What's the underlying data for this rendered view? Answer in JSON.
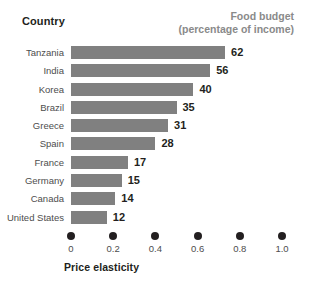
{
  "header": {
    "country_label": "Country",
    "budget_label_line1": "Food budget",
    "budget_label_line2": "(percentage of income)"
  },
  "axis": {
    "title": "Price elasticity",
    "tick_labels": [
      "0",
      "0.2",
      "0.4",
      "0.6",
      "0.8",
      "1.0"
    ]
  },
  "colors": {
    "bar": "#808080",
    "value_text": "#231f20",
    "country_text": "#4d4d4d",
    "budget_header_text": "#8a8a8a",
    "background": "#ffffff"
  },
  "chart_data": {
    "type": "bar",
    "orientation": "horizontal",
    "title": "",
    "xlabel": "Price elasticity",
    "ylabel": "Country",
    "xlim": [
      0,
      1.0
    ],
    "xticks": [
      0,
      0.2,
      0.4,
      0.6,
      0.8,
      1.0
    ],
    "grid": false,
    "legend": "none",
    "categories": [
      "Tanzania",
      "India",
      "Korea",
      "Brazil",
      "Greece",
      "Spain",
      "France",
      "Germany",
      "Canada",
      "United States"
    ],
    "series": [
      {
        "name": "Price elasticity",
        "encoding": "bar-length",
        "values": [
          0.73,
          0.66,
          0.58,
          0.5,
          0.46,
          0.4,
          0.27,
          0.24,
          0.21,
          0.17
        ]
      },
      {
        "name": "Food budget (percentage of income)",
        "encoding": "data-label",
        "values": [
          62,
          56,
          40,
          35,
          31,
          28,
          17,
          15,
          14,
          12
        ]
      }
    ],
    "rows": [
      {
        "country": "Tanzania",
        "elasticity": 0.73,
        "food_budget": "62"
      },
      {
        "country": "India",
        "elasticity": 0.66,
        "food_budget": "56"
      },
      {
        "country": "Korea",
        "elasticity": 0.58,
        "food_budget": "40"
      },
      {
        "country": "Brazil",
        "elasticity": 0.5,
        "food_budget": "35"
      },
      {
        "country": "Greece",
        "elasticity": 0.46,
        "food_budget": "31"
      },
      {
        "country": "Spain",
        "elasticity": 0.4,
        "food_budget": "28"
      },
      {
        "country": "France",
        "elasticity": 0.27,
        "food_budget": "17"
      },
      {
        "country": "Germany",
        "elasticity": 0.24,
        "food_budget": "15"
      },
      {
        "country": "Canada",
        "elasticity": 0.21,
        "food_budget": "14"
      },
      {
        "country": "United States",
        "elasticity": 0.17,
        "food_budget": "12"
      }
    ]
  }
}
